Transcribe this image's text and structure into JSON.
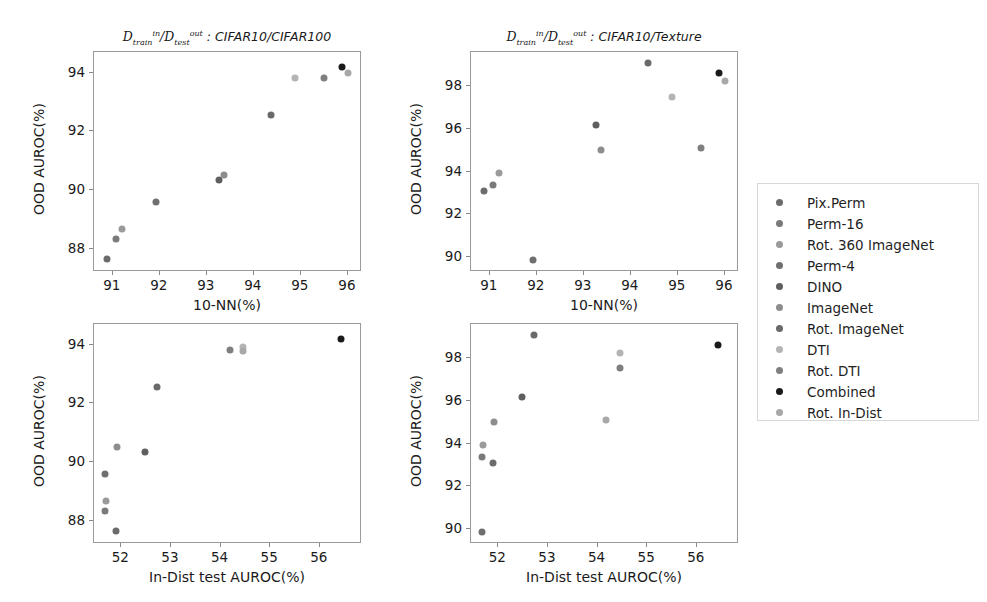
{
  "figure": {
    "width": 987,
    "height": 602,
    "background": "#ffffff"
  },
  "series_colors": {
    "Pix.Perm": "#6b6b6b",
    "Perm-16": "#7a7a7a",
    "Rot. 360 ImageNet": "#9a9a9a",
    "Perm-4": "#6f6f6f",
    "DINO": "#5f5f5f",
    "ImageNet": "#8d8d8d",
    "Rot. ImageNet": "#6a6a6a",
    "DTI": "#b4b4b4",
    "Rot. DTI": "#7f7f7f",
    "Combined": "#1a1a1a",
    "Rot. In-Dist": "#a8a8a8"
  },
  "legend": {
    "name": "legend",
    "position": "right",
    "items": [
      {
        "label": "Pix.Perm",
        "color": "#6b6b6b"
      },
      {
        "label": "Perm-16",
        "color": "#7a7a7a"
      },
      {
        "label": "Rot. 360 ImageNet",
        "color": "#9a9a9a"
      },
      {
        "label": "Perm-4",
        "color": "#6f6f6f"
      },
      {
        "label": "DINO",
        "color": "#5f5f5f"
      },
      {
        "label": "ImageNet",
        "color": "#8d8d8d"
      },
      {
        "label": "Rot. ImageNet",
        "color": "#6a6a6a"
      },
      {
        "label": "DTI",
        "color": "#b4b4b4"
      },
      {
        "label": "Rot. DTI",
        "color": "#7f7f7f"
      },
      {
        "label": "Combined",
        "color": "#1a1a1a"
      },
      {
        "label": "Rot. In-Dist",
        "color": "#a8a8a8"
      }
    ]
  },
  "chart_data": [
    {
      "id": "top-left",
      "type": "scatter",
      "title": "D_train^in / D_test^out : CIFAR10/CIFAR100",
      "title_parts": {
        "d1": "D",
        "sub1": "train",
        "sup1": "in",
        "sep": "/",
        "d2": "D",
        "sub2": "test",
        "sup2": "out",
        "colon": " : ",
        "datasets": "CIFAR10/CIFAR100"
      },
      "xlabel": "10-NN(%)",
      "ylabel": "OOD AUROC(%)",
      "xlim": [
        90.6,
        96.3
      ],
      "ylim": [
        87.2,
        94.7
      ],
      "xticks": [
        91,
        92,
        93,
        94,
        95,
        96
      ],
      "yticks": [
        88,
        90,
        92,
        94
      ],
      "grid": false,
      "points": [
        {
          "label": "Pix.Perm",
          "x": 90.87,
          "y": 87.65,
          "color": "#6b6b6b"
        },
        {
          "label": "Perm-16",
          "x": 91.07,
          "y": 88.33,
          "color": "#7a7a7a"
        },
        {
          "label": "Rot. 360 ImageNet",
          "x": 91.2,
          "y": 88.66,
          "color": "#9a9a9a"
        },
        {
          "label": "Perm-4",
          "x": 91.92,
          "y": 89.6,
          "color": "#6f6f6f"
        },
        {
          "label": "DINO",
          "x": 93.25,
          "y": 90.32,
          "color": "#5f5f5f"
        },
        {
          "label": "ImageNet",
          "x": 93.37,
          "y": 90.52,
          "color": "#8d8d8d"
        },
        {
          "label": "Rot. ImageNet",
          "x": 94.37,
          "y": 92.54,
          "color": "#6a6a6a"
        },
        {
          "label": "DTI",
          "x": 94.87,
          "y": 93.8,
          "color": "#b4b4b4"
        },
        {
          "label": "Rot. DTI",
          "x": 95.5,
          "y": 93.8,
          "color": "#7f7f7f"
        },
        {
          "label": "Combined",
          "x": 95.88,
          "y": 94.18,
          "color": "#1a1a1a"
        },
        {
          "label": "Rot. In-Dist",
          "x": 96.0,
          "y": 93.97,
          "color": "#a8a8a8"
        }
      ]
    },
    {
      "id": "top-right",
      "type": "scatter",
      "title": "D_train^in / D_test^out : CIFAR10/Texture",
      "title_parts": {
        "d1": "D",
        "sub1": "train",
        "sup1": "in",
        "sep": "/",
        "d2": "D",
        "sub2": "test",
        "sup2": "out",
        "colon": " : ",
        "datasets": "CIFAR10/Texture"
      },
      "xlabel": "10-NN(%)",
      "ylabel": "OOD AUROC(%)",
      "xlim": [
        90.6,
        96.3
      ],
      "ylim": [
        89.3,
        99.6
      ],
      "xticks": [
        91,
        92,
        93,
        94,
        95,
        96
      ],
      "yticks": [
        90,
        92,
        94,
        96,
        98
      ],
      "grid": false,
      "points": [
        {
          "label": "Pix.Perm",
          "x": 90.87,
          "y": 93.1,
          "color": "#6b6b6b"
        },
        {
          "label": "Perm-16",
          "x": 91.07,
          "y": 93.38,
          "color": "#7a7a7a"
        },
        {
          "label": "Rot. 360 ImageNet",
          "x": 91.2,
          "y": 93.95,
          "color": "#9a9a9a"
        },
        {
          "label": "Perm-4",
          "x": 91.92,
          "y": 89.88,
          "color": "#6f6f6f"
        },
        {
          "label": "DINO",
          "x": 93.25,
          "y": 96.2,
          "color": "#5f5f5f"
        },
        {
          "label": "ImageNet",
          "x": 93.37,
          "y": 95.03,
          "color": "#8d8d8d"
        },
        {
          "label": "Rot. ImageNet",
          "x": 94.37,
          "y": 99.1,
          "color": "#6a6a6a"
        },
        {
          "label": "DTI",
          "x": 94.87,
          "y": 97.5,
          "color": "#b4b4b4"
        },
        {
          "label": "Rot. DTI",
          "x": 95.5,
          "y": 95.12,
          "color": "#7f7f7f"
        },
        {
          "label": "Combined",
          "x": 95.88,
          "y": 98.62,
          "color": "#1a1a1a"
        },
        {
          "label": "Rot. In-Dist",
          "x": 96.0,
          "y": 98.22,
          "color": "#a8a8a8"
        }
      ]
    },
    {
      "id": "bottom-left",
      "type": "scatter",
      "title": "",
      "xlabel": "In-Dist test AUROC(%)",
      "ylabel": "OOD AUROC(%)",
      "xlim": [
        51.45,
        56.85
      ],
      "ylim": [
        87.2,
        94.7
      ],
      "xticks": [
        52,
        53,
        54,
        55,
        56
      ],
      "yticks": [
        88,
        90,
        92,
        94
      ],
      "grid": false,
      "points": [
        {
          "label": "Pix.Perm",
          "x": 51.9,
          "y": 87.65,
          "color": "#6b6b6b"
        },
        {
          "label": "Perm-16",
          "x": 51.68,
          "y": 88.33,
          "color": "#7a7a7a"
        },
        {
          "label": "Rot. 360 ImageNet",
          "x": 51.7,
          "y": 88.66,
          "color": "#9a9a9a"
        },
        {
          "label": "Perm-4",
          "x": 51.68,
          "y": 89.6,
          "color": "#6f6f6f"
        },
        {
          "label": "DINO",
          "x": 52.48,
          "y": 90.32,
          "color": "#5f5f5f"
        },
        {
          "label": "ImageNet",
          "x": 51.92,
          "y": 90.52,
          "color": "#8d8d8d"
        },
        {
          "label": "Rot. ImageNet",
          "x": 52.72,
          "y": 92.54,
          "color": "#6a6a6a"
        },
        {
          "label": "DTI",
          "x": 54.45,
          "y": 93.92,
          "color": "#b4b4b4"
        },
        {
          "label": "Rot. DTI",
          "x": 54.2,
          "y": 93.8,
          "color": "#7f7f7f"
        },
        {
          "label": "Combined",
          "x": 56.42,
          "y": 94.18,
          "color": "#1a1a1a"
        },
        {
          "label": "Rot. In-Dist",
          "x": 54.45,
          "y": 93.78,
          "color": "#a8a8a8"
        }
      ]
    },
    {
      "id": "bottom-right",
      "type": "scatter",
      "title": "",
      "xlabel": "In-Dist test AUROC(%)",
      "ylabel": "OOD AUROC(%)",
      "xlim": [
        51.45,
        56.85
      ],
      "ylim": [
        89.3,
        99.6
      ],
      "xticks": [
        52,
        53,
        54,
        55,
        56
      ],
      "yticks": [
        90,
        92,
        94,
        96,
        98
      ],
      "grid": false,
      "points": [
        {
          "label": "Pix.Perm",
          "x": 51.9,
          "y": 93.1,
          "color": "#6b6b6b"
        },
        {
          "label": "Perm-16",
          "x": 51.68,
          "y": 93.38,
          "color": "#7a7a7a"
        },
        {
          "label": "Rot. 360 ImageNet",
          "x": 51.7,
          "y": 93.95,
          "color": "#9a9a9a"
        },
        {
          "label": "Perm-4",
          "x": 51.68,
          "y": 89.88,
          "color": "#6f6f6f"
        },
        {
          "label": "DINO",
          "x": 52.48,
          "y": 96.2,
          "color": "#5f5f5f"
        },
        {
          "label": "ImageNet",
          "x": 51.92,
          "y": 95.03,
          "color": "#8d8d8d"
        },
        {
          "label": "Rot. ImageNet",
          "x": 52.72,
          "y": 99.1,
          "color": "#6a6a6a"
        },
        {
          "label": "DTI",
          "x": 54.45,
          "y": 98.22,
          "color": "#b4b4b4"
        },
        {
          "label": "Rot. DTI",
          "x": 54.45,
          "y": 97.55,
          "color": "#7f7f7f"
        },
        {
          "label": "Combined",
          "x": 56.42,
          "y": 98.62,
          "color": "#1a1a1a"
        },
        {
          "label": "Rot. In-Dist",
          "x": 54.18,
          "y": 95.12,
          "color": "#a8a8a8"
        }
      ]
    }
  ]
}
